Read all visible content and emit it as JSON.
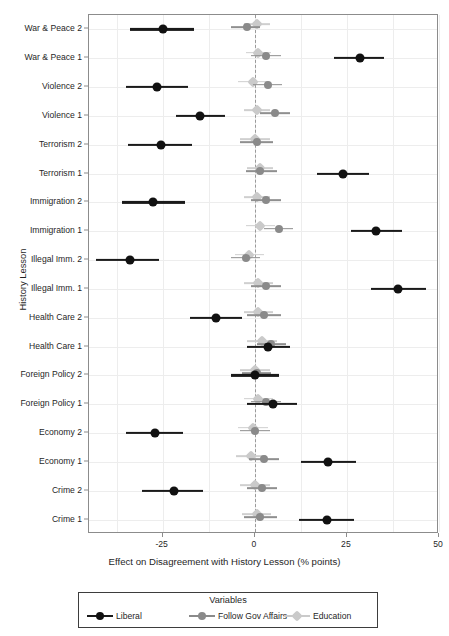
{
  "chart_data": {
    "type": "scatter",
    "plot_kind": "coefficient-forest-plot",
    "title": "",
    "xlabel": "Effect on Disagreement with History Lesson (% points)",
    "ylabel": "History Lesson",
    "xlim": [
      -45,
      50
    ],
    "xticks": [
      -25,
      0,
      25,
      50
    ],
    "xticklabels": [
      "-25",
      "0",
      "25",
      "50"
    ],
    "grid": true,
    "zero_reference_line": 0,
    "legend": {
      "title": "Variables",
      "position": "below-axes",
      "entries": [
        {
          "name": "Liberal",
          "color": "#111111",
          "marker": "circle"
        },
        {
          "name": "Follow Gov Affairs",
          "color": "#8a8a8a",
          "marker": "circle"
        },
        {
          "name": "Education",
          "color": "#cacaca",
          "marker": "diamond"
        }
      ]
    },
    "categories": [
      "War & Peace 2",
      "War & Peace 1",
      "Violence 2",
      "Violence 1",
      "Terrorism 2",
      "Terrorism 1",
      "Immigration 2",
      "Immigration 1",
      "Illegal Imm. 2",
      "Illegal Imm. 1",
      "Health Care 2",
      "Health Care 1",
      "Foreign Policy 2",
      "Foreign Policy 1",
      "Economy 2",
      "Economy 1",
      "Crime 2",
      "Crime 1"
    ],
    "series": [
      {
        "name": "Liberal",
        "color": "#111111",
        "values": [
          -25.0,
          28.5,
          -26.5,
          -15.0,
          -25.5,
          24.0,
          -27.5,
          33.0,
          -34.0,
          39.0,
          -10.5,
          3.5,
          0.0,
          5.0,
          -27.0,
          20.0,
          -22.0,
          19.5
        ],
        "ci_low": [
          -34.0,
          21.5,
          -35.0,
          -21.5,
          -34.5,
          17.0,
          -36.0,
          26.0,
          -43.0,
          31.5,
          -17.5,
          -2.0,
          -6.5,
          -2.0,
          -35.0,
          12.5,
          -30.5,
          12.0
        ],
        "ci_high": [
          -16.5,
          35.0,
          -18.0,
          -8.0,
          -17.0,
          31.0,
          -19.0,
          40.0,
          -26.0,
          46.5,
          -3.5,
          9.5,
          6.5,
          11.5,
          -19.5,
          27.5,
          -14.0,
          27.0
        ]
      },
      {
        "name": "Follow Gov Affairs",
        "color": "#8a8a8a",
        "values": [
          -2.0,
          3.0,
          3.5,
          5.5,
          0.5,
          1.5,
          3.0,
          6.5,
          -2.5,
          3.0,
          2.5,
          4.5,
          0.5,
          3.0,
          0.0,
          2.5,
          2.0,
          1.5
        ],
        "ci_low": [
          -6.5,
          -1.0,
          -0.5,
          1.5,
          -4.0,
          -2.5,
          -1.0,
          2.5,
          -6.5,
          -1.0,
          -2.0,
          0.5,
          -3.5,
          -1.0,
          -4.0,
          -1.5,
          -2.0,
          -3.0
        ],
        "ci_high": [
          1.5,
          7.0,
          7.5,
          9.5,
          5.0,
          6.0,
          7.0,
          10.5,
          1.5,
          7.0,
          7.0,
          8.5,
          4.5,
          7.0,
          4.0,
          6.5,
          6.0,
          6.0
        ]
      },
      {
        "name": "Education",
        "color": "#cacaca",
        "values": [
          0.5,
          1.0,
          -0.5,
          0.5,
          0.0,
          1.5,
          0.5,
          1.5,
          -1.5,
          1.0,
          1.0,
          2.0,
          0.0,
          1.0,
          -0.5,
          -1.0,
          0.0,
          0.5
        ],
        "ci_low": [
          -3.0,
          -2.5,
          -4.5,
          -3.0,
          -4.0,
          -2.0,
          -3.0,
          -2.5,
          -5.5,
          -3.0,
          -3.0,
          -2.0,
          -4.0,
          -3.0,
          -4.5,
          -5.0,
          -4.0,
          -3.5
        ],
        "ci_high": [
          4.0,
          4.5,
          3.5,
          4.0,
          4.0,
          5.0,
          4.0,
          5.5,
          2.5,
          5.0,
          5.0,
          6.0,
          4.0,
          5.0,
          3.5,
          3.0,
          4.0,
          4.5
        ]
      }
    ]
  }
}
